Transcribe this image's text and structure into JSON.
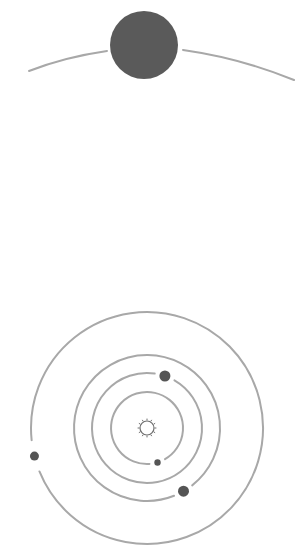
{
  "canvas": {
    "width": 308,
    "height": 546,
    "background": "#ffffff"
  },
  "colors": {
    "orbit": "#a8a8a8",
    "planet": "#555555",
    "big_planet": "#5a5a5a",
    "sun_stroke": "#6e6e6e"
  },
  "top_scene": {
    "big_planet": {
      "cx": 144,
      "cy": 45,
      "r": 34
    },
    "horizon_arc": {
      "left": {
        "x1": 29,
        "y1": 71,
        "qx": 65,
        "qy": 57,
        "x2": 107,
        "y2": 51
      },
      "right": {
        "x1": 183,
        "y1": 50,
        "qx": 240,
        "qy": 58,
        "x2": 294,
        "y2": 80
      }
    }
  },
  "solar_system": {
    "center": {
      "x": 147,
      "y": 428
    },
    "sun": {
      "r": 7,
      "rays": 12
    },
    "orbits": [
      {
        "name": "orbit-1",
        "r": 36,
        "planet": {
          "angle_deg": 73,
          "r": 3.2
        }
      },
      {
        "name": "orbit-2",
        "r": 55,
        "planet": {
          "angle_deg": -71,
          "r": 5.5
        }
      },
      {
        "name": "orbit-3",
        "r": 73,
        "planet": {
          "angle_deg": 60,
          "r": 5.5
        }
      },
      {
        "name": "orbit-4",
        "r": 116,
        "planet": {
          "angle_deg": 166,
          "r": 4.5
        }
      }
    ],
    "gap_deg": 16
  }
}
